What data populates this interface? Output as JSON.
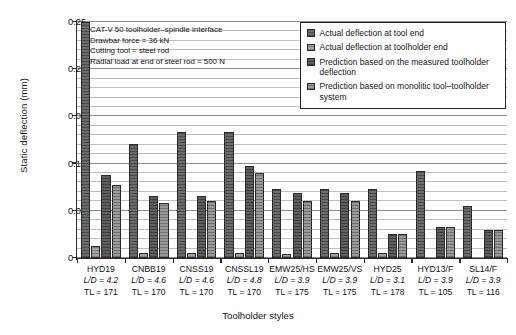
{
  "chart_data": {
    "type": "bar",
    "title": "",
    "xlabel": "Toolholder styles",
    "ylabel": "Static deflection (mm)",
    "ylim": [
      0,
      0.25
    ],
    "grid": true,
    "legend_position": "top-right",
    "y_ticks": [
      "0",
      "0.05",
      "0.1",
      "0.05",
      "0.2",
      "0.25"
    ],
    "y_tick_values": [
      0,
      0.05,
      0.1,
      0.15,
      0.2,
      0.25
    ],
    "categories": [
      "HYD19",
      "CNBB19",
      "CNSS19",
      "CNSSL19",
      "EMW25/HS",
      "EMW25/VS",
      "HYD25",
      "HYD13/F",
      "SL14/F"
    ],
    "category_ld": [
      "L/D = 4.2",
      "L/D = 4.6",
      "L/D = 4.6",
      "L/D = 4.8",
      "L/D = 3.9",
      "L/D = 3.9",
      "L/D = 3.1",
      "L/D = 3.9",
      "L/D = 3.9"
    ],
    "category_tl": [
      "TL = 171",
      "TL = 170",
      "TL = 170",
      "TL = 170",
      "TL = 175",
      "TL = 175",
      "TL = 178",
      "TL = 105",
      "TL = 116"
    ],
    "series": [
      {
        "name": "Actual deflection at tool end",
        "values": [
          0.25,
          0.121,
          0.133,
          0.133,
          0.073,
          0.073,
          0.073,
          0.092,
          0.055
        ]
      },
      {
        "name": "Actual deflection at toolholder end",
        "values": [
          0.013,
          0.005,
          0.005,
          0.005,
          0.004,
          0.005,
          0.005,
          0.0,
          0.0
        ]
      },
      {
        "name": "Prediction based on the measured toolholder deflection",
        "values": [
          0.088,
          0.066,
          0.066,
          0.097,
          0.069,
          0.069,
          0.025,
          0.033,
          0.03
        ]
      },
      {
        "name": "Prediction based on monolitic tool–toolholder system",
        "values": [
          0.077,
          0.058,
          0.06,
          0.09,
          0.06,
          0.06,
          0.025,
          0.033,
          0.03
        ]
      }
    ],
    "annotations": [
      "CAT-V 50 toolholder–spindle interface",
      "Drawbar force = 36 kN",
      "Cutting tool = steel rod",
      "Radial load at end of steel rod = 500 N"
    ]
  },
  "legend": {
    "items": [
      "Actual deflection at tool end",
      "Actual deflection at toolholder end",
      "Prediction based on the measured toolholder deflection",
      "Prediction based on monolitic tool–toolholder system"
    ]
  }
}
